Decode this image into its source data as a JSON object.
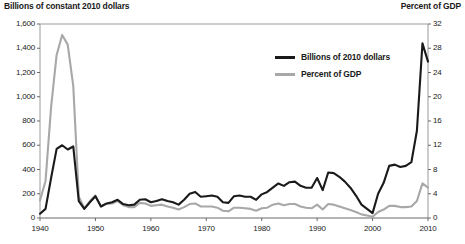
{
  "header": {
    "left_axis_title": "Billions of constant 2010 dollars",
    "right_axis_title": "Percent of GDP"
  },
  "legend": {
    "items": [
      {
        "label": "Billions of 2010 dollars",
        "color": "#1a1a1a"
      },
      {
        "label": "Percent of GDP",
        "color": "#a8a8a8"
      }
    ]
  },
  "chart_data": {
    "type": "line",
    "title": "",
    "subtitle": "",
    "xlabel": "",
    "ylabel": "Billions of constant 2010 dollars",
    "y2label": "Percent of GDP",
    "xlim": [
      1940,
      2010
    ],
    "ylim": [
      0,
      1600
    ],
    "y2lim": [
      0,
      32
    ],
    "grid": false,
    "legend_position": "upper-center-right",
    "xticks": [
      1940,
      1950,
      1960,
      1970,
      1980,
      1990,
      2000,
      2010
    ],
    "xtick_labels": [
      "1940",
      "1950",
      "1960",
      "1970",
      "1980",
      "1990",
      "2000",
      "2010"
    ],
    "yticks": [
      0,
      200,
      400,
      600,
      800,
      1000,
      1200,
      1400,
      1600
    ],
    "ytick_labels": [
      "0",
      "200",
      "400",
      "600",
      "800",
      "1,000",
      "1,200",
      "1,400",
      "1,600"
    ],
    "y2ticks": [
      0,
      4,
      8,
      12,
      16,
      20,
      24,
      28,
      32
    ],
    "y2tick_labels": [
      "0",
      "4",
      "8",
      "12",
      "16",
      "20",
      "24",
      "28",
      "32"
    ],
    "x": [
      1940,
      1941,
      1942,
      1943,
      1944,
      1945,
      1946,
      1947,
      1948,
      1949,
      1950,
      1951,
      1952,
      1953,
      1954,
      1955,
      1956,
      1957,
      1958,
      1959,
      1960,
      1961,
      1962,
      1963,
      1964,
      1965,
      1966,
      1967,
      1968,
      1969,
      1970,
      1971,
      1972,
      1973,
      1974,
      1975,
      1976,
      1977,
      1978,
      1979,
      1980,
      1981,
      1982,
      1983,
      1984,
      1985,
      1986,
      1987,
      1988,
      1989,
      1990,
      1991,
      1992,
      1993,
      1994,
      1995,
      1996,
      1997,
      1998,
      1999,
      2000,
      2001,
      2002,
      2003,
      2004,
      2005,
      2006,
      2007,
      2008,
      2009,
      2010
    ],
    "series": [
      {
        "name": "Billions of 2010 dollars",
        "color": "#1a1a1a",
        "axis": "left",
        "values": [
          35,
          75,
          330,
          570,
          600,
          565,
          590,
          140,
          75,
          130,
          180,
          95,
          120,
          130,
          150,
          115,
          105,
          110,
          150,
          155,
          130,
          140,
          155,
          140,
          130,
          110,
          150,
          200,
          215,
          175,
          180,
          185,
          175,
          130,
          125,
          180,
          185,
          175,
          175,
          150,
          195,
          215,
          250,
          285,
          265,
          295,
          300,
          265,
          250,
          250,
          330,
          230,
          375,
          370,
          340,
          300,
          250,
          185,
          110,
          75,
          40,
          200,
          290,
          430,
          440,
          420,
          430,
          460,
          720,
          1440,
          1290
        ]
      },
      {
        "name": "Percent of GDP",
        "color": "#a8a8a8",
        "axis": "right",
        "values": [
          2.9,
          6.1,
          18.3,
          26.9,
          30.2,
          28.6,
          21.8,
          3.5,
          1.6,
          2.8,
          3.7,
          1.9,
          2.3,
          2.4,
          2.8,
          2.1,
          1.8,
          1.8,
          2.5,
          2.4,
          2.0,
          2.1,
          2.2,
          1.9,
          1.7,
          1.4,
          1.8,
          2.3,
          2.4,
          1.9,
          1.9,
          1.9,
          1.7,
          1.2,
          1.1,
          1.7,
          1.7,
          1.6,
          1.5,
          1.2,
          1.6,
          1.7,
          2.2,
          2.4,
          2.1,
          2.3,
          2.3,
          1.9,
          1.7,
          1.6,
          2.2,
          1.4,
          2.3,
          2.2,
          1.9,
          1.6,
          1.3,
          1.0,
          0.6,
          0.4,
          0.2,
          1.0,
          1.4,
          2.0,
          2.0,
          1.8,
          1.8,
          1.9,
          2.8,
          5.7,
          5.0
        ]
      }
    ]
  }
}
